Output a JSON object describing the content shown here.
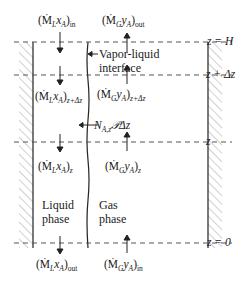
{
  "diagram": {
    "levels": [
      {
        "id": "top",
        "label": "z = H"
      },
      {
        "id": "upper",
        "label": "z + Δz"
      },
      {
        "id": "lower",
        "label": "z"
      },
      {
        "id": "bottom",
        "label": "z = 0"
      }
    ],
    "phases": {
      "liquid": {
        "line1": "Liquid",
        "line2": "phase"
      },
      "gas": {
        "line1": "Gas",
        "line2": "phase"
      }
    },
    "interface": {
      "line1": "Vapor-liquid",
      "line2": "interface"
    },
    "flows": {
      "liquid_in": {
        "base": "(Ṁ",
        "sym": "L",
        "mid": "x",
        "var": "A",
        "close": ")",
        "sub": "in"
      },
      "gas_out": {
        "base": "(Ṁ",
        "sym": "G",
        "mid": "y",
        "var": "A",
        "close": ")",
        "sub": "out"
      },
      "liquid_z_dz": {
        "base": "(Ṁ",
        "sym": "L",
        "mid": "x",
        "var": "A",
        "close": ")",
        "sub": "z+Δz"
      },
      "gas_z_dz": {
        "base": "(Ṁ",
        "sym": "G",
        "mid": "y",
        "var": "A",
        "close": ")",
        "sub": "z+Δz"
      },
      "liquid_z": {
        "base": "(Ṁ",
        "sym": "L",
        "mid": "x",
        "var": "A",
        "close": ")",
        "sub": "z"
      },
      "gas_z": {
        "base": "(Ṁ",
        "sym": "G",
        "mid": "y",
        "var": "A",
        "close": ")",
        "sub": "z"
      },
      "liquid_out": {
        "base": "(Ṁ",
        "sym": "L",
        "mid": "x",
        "var": "A",
        "close": ")",
        "sub": "out"
      },
      "gas_in": {
        "base": "(Ṁ",
        "sym": "G",
        "mid": "y",
        "var": "A",
        "close": ")",
        "sub": "in"
      }
    },
    "flux": {
      "N": "N",
      "sub": "A,z",
      "rest": "𝒫Δz"
    }
  }
}
